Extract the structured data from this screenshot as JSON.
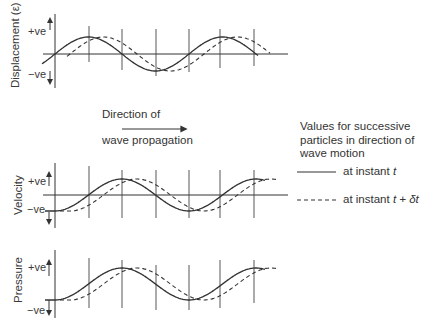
{
  "panels": [
    {
      "id": "displacement",
      "ylabel": "Displacement (ε)",
      "pos_label": "+ve",
      "neg_label": "−ve"
    },
    {
      "id": "velocity",
      "ylabel": "Velocity",
      "pos_label": "+ve",
      "neg_label": "−ve"
    },
    {
      "id": "pressure",
      "ylabel": "Pressure",
      "pos_label": "+ve",
      "neg_label": "−ve"
    }
  ],
  "direction": {
    "line1": "Direction of",
    "line2": "wave propagation",
    "icon": "right-arrow-icon"
  },
  "legend": {
    "title": "Values for successive particles in direction of wave motion",
    "solid_label": "at instant ",
    "solid_var": "t",
    "dashed_label": "at instant ",
    "dashed_var": "t + δt"
  },
  "colors": {
    "line": "#333333",
    "pressure_axis_left": "#b5bd6a",
    "pressure_axis_right": "#3b3f7a"
  }
}
